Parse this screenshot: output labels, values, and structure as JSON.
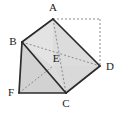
{
  "figure": {
    "type": "geometry-diagram",
    "background_color": "#ffffff",
    "stroke_color": "#2b2b2b",
    "dashed_color": "#8c8c8c",
    "fill_light": "#e3e3e3",
    "fill_mid": "#dcdcdc",
    "fill_dark": "#cfcfcf",
    "width": 122,
    "height": 117,
    "vertices": [
      {
        "id": "A",
        "label": "A",
        "x": 53,
        "y": 19,
        "label_x": 53,
        "label_y": 11
      },
      {
        "id": "B",
        "label": "B",
        "x": 22,
        "y": 42,
        "label_x": 13,
        "label_y": 45
      },
      {
        "id": "C",
        "label": "C",
        "x": 66,
        "y": 93,
        "label_x": 66,
        "label_y": 107
      },
      {
        "id": "D",
        "label": "D",
        "x": 100,
        "y": 66,
        "label_x": 110,
        "label_y": 70
      },
      {
        "id": "E",
        "label": "E",
        "x": 53,
        "y": 66,
        "label_x": 56,
        "label_y": 62
      },
      {
        "id": "F",
        "label": "F",
        "x": 19,
        "y": 93,
        "label_x": 11,
        "label_y": 96
      },
      {
        "id": "G",
        "label": "",
        "x": 100,
        "y": 19,
        "label_x": 100,
        "label_y": 19
      }
    ],
    "solid_edges": [
      {
        "from": "A",
        "to": "B",
        "name": "edge-ab"
      },
      {
        "from": "B",
        "to": "C",
        "name": "edge-bc"
      },
      {
        "from": "C",
        "to": "D",
        "name": "edge-cd"
      },
      {
        "from": "D",
        "to": "A",
        "name": "edge-da"
      },
      {
        "from": "B",
        "to": "F",
        "name": "edge-bf"
      },
      {
        "from": "F",
        "to": "C",
        "name": "edge-fc"
      }
    ],
    "dashed_edges": [
      {
        "from": "A",
        "to": "G",
        "name": "dashed-a-corner"
      },
      {
        "from": "G",
        "to": "D",
        "name": "dashed-corner-d"
      },
      {
        "from": "A",
        "to": "D",
        "name": "dashed-ad-diagonal"
      },
      {
        "from": "A",
        "to": "C",
        "name": "dashed-ac-vertical"
      },
      {
        "from": "B",
        "to": "D",
        "name": "dashed-bd-horizontal"
      },
      {
        "from": "F",
        "to": "E",
        "name": "dashed-fe-diagonal"
      }
    ],
    "faces": [
      {
        "name": "face-abe",
        "points": "53,19 22,42 53,66",
        "fill": "#e3e3e3"
      },
      {
        "name": "face-aed",
        "points": "53,19 53,66 100,66",
        "fill": "#dcdcdc"
      },
      {
        "name": "face-bec",
        "points": "22,42 53,66 66,93",
        "fill": "#dcdcdc"
      },
      {
        "name": "face-ecd",
        "points": "53,66 66,93 100,66",
        "fill": "#d9d9d9"
      },
      {
        "name": "face-bfc",
        "points": "22,42 19,93 66,93",
        "fill": "#d2d2d2"
      }
    ]
  }
}
